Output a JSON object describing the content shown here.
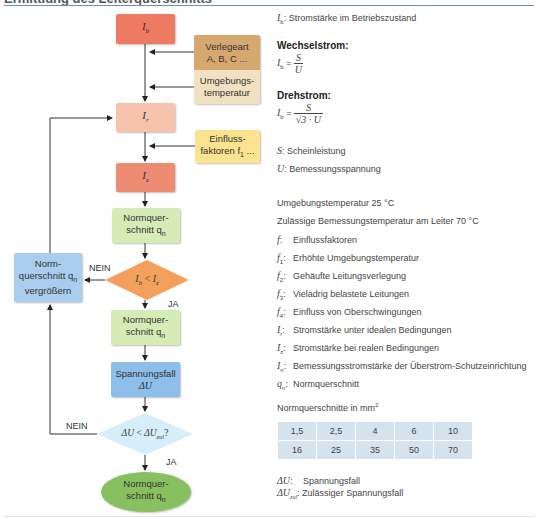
{
  "header": {
    "title": "Ermittlung des Leiterquerschnitts"
  },
  "flowchart": {
    "nodes": {
      "ib": {
        "label": "I",
        "sub": "b",
        "color": "#ee7a62"
      },
      "verlegeart": {
        "line1": "Verlegeart",
        "line2": "A, B, C ...",
        "color": "#d6a870"
      },
      "umgebung": {
        "line1": "Umgebungs-",
        "line2": "temperatur",
        "color": "#f1e1c1"
      },
      "ir": {
        "label": "I",
        "sub": "r",
        "color": "#f6c3ac"
      },
      "einfluss": {
        "line1": "Einfluss-",
        "line2": "faktoren f",
        "sub": "1",
        "suffix": " ...",
        "color": "#fbe38f"
      },
      "iz": {
        "label": "I",
        "sub": "z",
        "color": "#ee8c73"
      },
      "norm1": {
        "line1": "Normquer-",
        "line2": "schnitt q",
        "sub": "n",
        "color": "#d6ecb6"
      },
      "decision1": {
        "label": "I_b < I_z",
        "a": "I",
        "asub": "b",
        "op": " < ",
        "b": "I",
        "bsub": "z",
        "color": "#f2a05c"
      },
      "enlarge": {
        "line1": "Norm-",
        "line2": "querschnitt q",
        "sub": "n",
        "line3": "vergrößern",
        "color": "#a9cdef"
      },
      "norm2": {
        "line1": "Normquer-",
        "line2": "schnitt q",
        "sub": "n",
        "color": "#d6ecb6"
      },
      "spannungsfall": {
        "line1": "Spannungsfall",
        "line2": "ΔU",
        "color": "#8dbde9"
      },
      "decision2": {
        "a": "ΔU",
        "op": " < ",
        "b": "ΔU",
        "bsub": "zul",
        "suffix": "?",
        "color": "#d6eef9"
      },
      "result": {
        "line1": "Normquer-",
        "line2": "schnitt q",
        "sub": "n",
        "color": "#88c060"
      }
    },
    "labels": {
      "nein1": "NEIN",
      "ja1": "JA",
      "nein2": "NEIN",
      "ja2": "JA"
    }
  },
  "legend": {
    "ib_def": {
      "sym": "I",
      "sub": "b",
      "text": ": Stromstärke im Betriebszustand"
    },
    "wechselstrom": {
      "heading": "Wechselstrom:",
      "lhs": "I",
      "lhs_sub": "b",
      "eq": " = ",
      "num": "S",
      "den": "U"
    },
    "drehstrom": {
      "heading": "Drehstrom:",
      "lhs": "I",
      "lhs_sub": "b",
      "eq": " = ",
      "num": "S",
      "den": "√3 · U"
    },
    "s_def": {
      "sym": "S",
      "text": ": Scheinleistung"
    },
    "u_def": {
      "sym": "U",
      "text": ": Bemessungsspannung"
    },
    "ambient": "Umgebungstemperatur 25 °C",
    "conductor": "Zulässige Bemessungstemperatur am Leiter 70 °C",
    "factors": [
      {
        "sym": "f",
        "sub": "",
        "text": "Einflussfaktoren"
      },
      {
        "sym": "f",
        "sub": "1",
        "text": "Erhöhte Umgebungstemperatur"
      },
      {
        "sym": "f",
        "sub": "2",
        "text": "Gehäufte Leitungsverlegung"
      },
      {
        "sym": "f",
        "sub": "3",
        "text": "Vieladrig belastete Leitungen"
      },
      {
        "sym": "f",
        "sub": "4",
        "text": "Einfluss von Oberschwingungen"
      },
      {
        "sym": "I",
        "sub": "r",
        "text": "Stromstärke unter idealen Bedingungen"
      },
      {
        "sym": "I",
        "sub": "z",
        "text": "Stromstärke bei realen Bedingungen"
      },
      {
        "sym": "I",
        "sub": "n",
        "text": "Bemessungsstromstärke der Überstrom-Schutzeinrichtung"
      },
      {
        "sym": "q",
        "sub": "n",
        "text": "Normquerschnitt"
      }
    ],
    "table_title": "Normquerschnitte in mm",
    "table_title_sup": "2",
    "table": [
      [
        "1,5",
        "2,5",
        "4",
        "6",
        "10"
      ],
      [
        "16",
        "25",
        "35",
        "50",
        "70"
      ]
    ],
    "du_def": {
      "sym": "ΔU",
      "text": "Spannungsfall"
    },
    "duzul_def": {
      "sym": "ΔU",
      "sub": "zul",
      "text": ": Zulässiger Spannungsfall"
    }
  }
}
